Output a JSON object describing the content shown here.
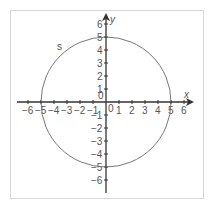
{
  "chart_data": {
    "type": "diagram",
    "title": "",
    "xlabel": "x",
    "ylabel": "y",
    "x_ticks": [
      -6,
      -5,
      -4,
      -3,
      -2,
      -1,
      0,
      1,
      2,
      3,
      4,
      5,
      6
    ],
    "y_ticks": [
      -6,
      -5,
      -4,
      -3,
      -2,
      -1,
      0,
      1,
      2,
      3,
      4,
      5,
      6
    ],
    "xlim": [
      -6,
      6
    ],
    "ylim": [
      -6,
      6
    ],
    "grid": false,
    "shapes": [
      {
        "type": "circle",
        "label": "s",
        "center": [
          0,
          0
        ],
        "radius": 5,
        "color": "#777777"
      }
    ]
  },
  "labels": {
    "x_axis": "x",
    "y_axis": "y",
    "circle": "s",
    "origin_x": "0",
    "origin_y": "0"
  }
}
